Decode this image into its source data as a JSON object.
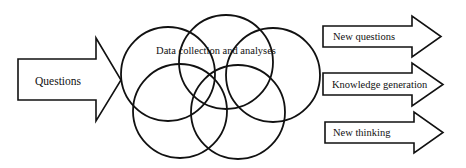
{
  "diagram": {
    "colors": {
      "stroke": "#111111",
      "fill": "#ffffff",
      "background": "#ffffff"
    },
    "input_arrow": {
      "label": "Questions"
    },
    "center": {
      "label": "Data collection and analyses",
      "circle_count": 5
    },
    "output_arrows": [
      {
        "label": "New questions"
      },
      {
        "label": "Knowledge generation"
      },
      {
        "label": "New thinking"
      }
    ]
  }
}
